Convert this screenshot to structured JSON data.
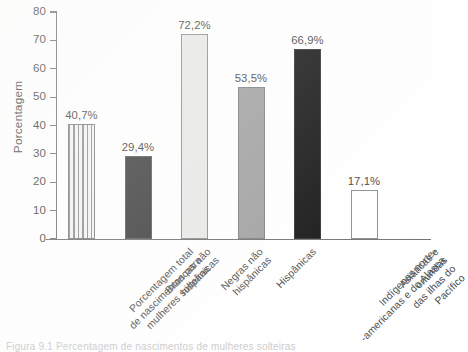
{
  "chart_data": {
    "type": "bar",
    "title": "",
    "xlabel": "",
    "ylabel": "Porcentagem",
    "ylim": [
      0,
      80
    ],
    "yticks": [
      0,
      10,
      20,
      30,
      40,
      50,
      60,
      70,
      80
    ],
    "ytick_labels": [
      "0",
      "10",
      "20",
      "30",
      "40",
      "50",
      "60",
      "70",
      "80"
    ],
    "grid": false,
    "legend": false,
    "categories": [
      "Porcentagem total\nde nascimentos para\nmulheres solteiras",
      "Brancas não\nhispânicas",
      "Negras não\nhispânicas",
      "Hispânicas",
      "Indígenas norte-\n-americanas e do Alasca",
      "Asiáticas e oriundas\ndas ilhas do Pacífico"
    ],
    "values": [
      40.7,
      29.4,
      72.2,
      53.5,
      66.9,
      17.1
    ],
    "value_labels": [
      "40,7%",
      "29,4%",
      "72,2%",
      "53,5%",
      "66,9%",
      "17,1%"
    ],
    "bar_fills": [
      "hatch-vertical",
      "#3a3a3a",
      "#e8e8e6",
      "#9e9e9e",
      "#0d0d0d",
      "#ffffff"
    ],
    "bar_edges": [
      "#7a7a7a",
      "#5a5a5a",
      "#8a8a8a",
      "#7c7c7c",
      "#2a2a2a",
      "#8a8a8a"
    ]
  },
  "axis": {
    "y_title": "Porcentagem"
  },
  "caption": {
    "text": "Figura 9.1 Percentagem de nascimentos de mulheres solteiras"
  }
}
